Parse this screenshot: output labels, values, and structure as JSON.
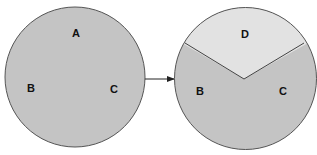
{
  "diagram": {
    "left_circle": {
      "labels": {
        "a": "A",
        "b": "B",
        "c": "C"
      },
      "fill": "#c4c4c4",
      "stroke": "#555555"
    },
    "right_circle": {
      "labels": {
        "d": "D",
        "b": "B",
        "c": "C"
      },
      "fill_main": "#c4c4c4",
      "fill_top": "#e2e2e2",
      "stroke": "#555555"
    },
    "arrow": {
      "direction": "right",
      "color": "#222222"
    }
  }
}
